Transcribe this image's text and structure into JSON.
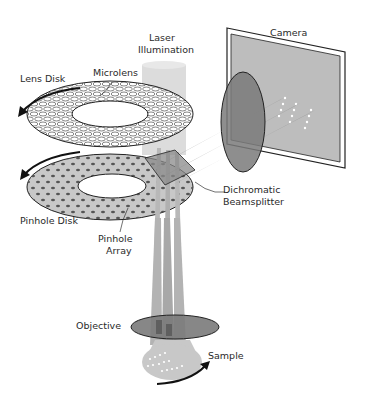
{
  "labels": {
    "laser_line1": "Laser",
    "laser_line2": "Illumination",
    "camera": "Camera",
    "lens_disk": "Lens Disk",
    "microlens": "Microlens",
    "pinhole_disk": "Pinhole Disk",
    "pinhole_array_line1": "Pinhole",
    "pinhole_array_line2": "Array",
    "dichromatic_line1": "Dichromatic",
    "dichromatic_line2": "Beamsplitter",
    "objective": "Objective",
    "sample": "Sample"
  },
  "colors": {
    "beam": "#b3b3b3",
    "beam_light": "#d4d4d4",
    "pinhole_disk_fill": "#c8c8c8",
    "lens_fill": "#7a7a7a",
    "camera_sensor": "#bdbdbd",
    "outline": "#222222"
  }
}
